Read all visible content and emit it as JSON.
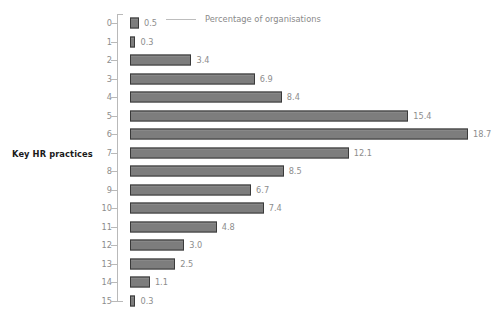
{
  "chart_data": {
    "type": "bar",
    "orientation": "horizontal",
    "title": "",
    "xlabel": "Percentage of organisations",
    "ylabel": "Key HR practices",
    "categories": [
      "0",
      "1",
      "2",
      "3",
      "4",
      "5",
      "6",
      "7",
      "8",
      "9",
      "10",
      "11",
      "12",
      "13",
      "14",
      "15"
    ],
    "values": [
      0.5,
      0.3,
      3.4,
      6.9,
      8.4,
      15.4,
      18.7,
      12.1,
      8.5,
      6.7,
      7.4,
      4.8,
      3.0,
      2.5,
      1.1,
      0.3
    ],
    "value_labels": [
      "0.5",
      "0.3",
      "3.4",
      "6.9",
      "8.4",
      "15.4",
      "18.7",
      "12.1",
      "8.5",
      "6.7",
      "7.4",
      "4.8",
      "3.0",
      "2.5",
      "1.1",
      "0.3"
    ],
    "xlim": [
      0,
      18.7
    ],
    "grid": false,
    "legend": {
      "position": "top",
      "entries": [
        "Percentage of organisations"
      ]
    },
    "colors": {
      "bar_fill": "#7d7d7d",
      "bar_border": "#3a3a3a",
      "axis": "#b9b9b9",
      "tick_text": "#8d8d8d",
      "value_text": "#8d8d8d",
      "axis_title": "#1a1a1a",
      "legend_text": "#8a8a8a",
      "background": "#ffffff"
    }
  },
  "axis": {
    "y_title": "Key HR practices"
  },
  "legend": {
    "label": "Percentage of organisations"
  }
}
